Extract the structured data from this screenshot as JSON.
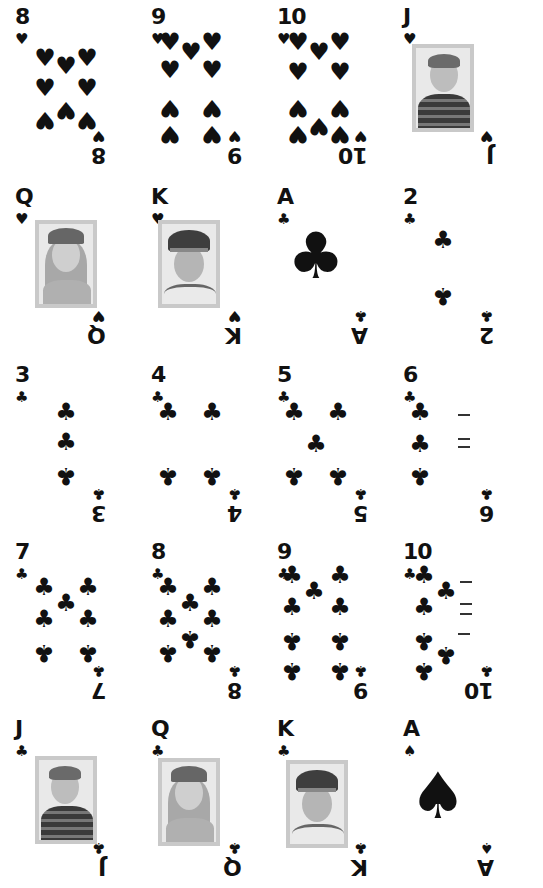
{
  "sheet": {
    "background": "#ffffff",
    "ink": "#111111",
    "frame_color": "#c9c9c9"
  },
  "cards": [
    {
      "rank": "8",
      "suit": "hearts",
      "glyph": "♥",
      "type": "pips"
    },
    {
      "rank": "9",
      "suit": "hearts",
      "glyph": "♥",
      "type": "pips"
    },
    {
      "rank": "10",
      "suit": "hearts",
      "glyph": "♥",
      "type": "pips"
    },
    {
      "rank": "J",
      "suit": "hearts",
      "glyph": "♥",
      "type": "face",
      "portrait": "boy-striped-shirt"
    },
    {
      "rank": "Q",
      "suit": "hearts",
      "glyph": "♥",
      "type": "face",
      "portrait": "girl-knit-hat"
    },
    {
      "rank": "K",
      "suit": "hearts",
      "glyph": "♥",
      "type": "face",
      "portrait": "pilot-captain-hat"
    },
    {
      "rank": "A",
      "suit": "clubs",
      "glyph": "♣",
      "type": "ace"
    },
    {
      "rank": "2",
      "suit": "clubs",
      "glyph": "♣",
      "type": "pips"
    },
    {
      "rank": "3",
      "suit": "clubs",
      "glyph": "♣",
      "type": "pips"
    },
    {
      "rank": "4",
      "suit": "clubs",
      "glyph": "♣",
      "type": "pips"
    },
    {
      "rank": "5",
      "suit": "clubs",
      "glyph": "♣",
      "type": "pips"
    },
    {
      "rank": "6",
      "suit": "clubs",
      "glyph": "♣",
      "type": "pips",
      "note": "right column pips partially rendered"
    },
    {
      "rank": "7",
      "suit": "clubs",
      "glyph": "♣",
      "type": "pips"
    },
    {
      "rank": "8",
      "suit": "clubs",
      "glyph": "♣",
      "type": "pips"
    },
    {
      "rank": "9",
      "suit": "clubs",
      "glyph": "♣",
      "type": "pips"
    },
    {
      "rank": "10",
      "suit": "clubs",
      "glyph": "♣",
      "type": "pips",
      "note": "right column pips partially rendered"
    },
    {
      "rank": "J",
      "suit": "clubs",
      "glyph": "♣",
      "type": "face",
      "portrait": "boy-striped-shirt"
    },
    {
      "rank": "Q",
      "suit": "clubs",
      "glyph": "♣",
      "type": "face",
      "portrait": "girl-knit-hat"
    },
    {
      "rank": "K",
      "suit": "clubs",
      "glyph": "♣",
      "type": "face",
      "portrait": "pilot-captain-hat"
    },
    {
      "rank": "A",
      "suit": "spades",
      "glyph": "♠",
      "type": "ace"
    }
  ]
}
